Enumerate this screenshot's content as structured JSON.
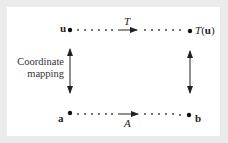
{
  "diagram": {
    "type": "commutative-diagram",
    "nodes": {
      "top_left": "u",
      "top_right_func": "T",
      "top_right_arg": "u",
      "bottom_left": "a",
      "bottom_right": "b"
    },
    "edges": {
      "top": "T",
      "bottom": "A",
      "left_caption_line1": "Coordinate",
      "left_caption_line2": "mapping"
    },
    "colors": {
      "background": "#ebebeb",
      "panel": "#ffffff",
      "ink": "#222222"
    }
  }
}
